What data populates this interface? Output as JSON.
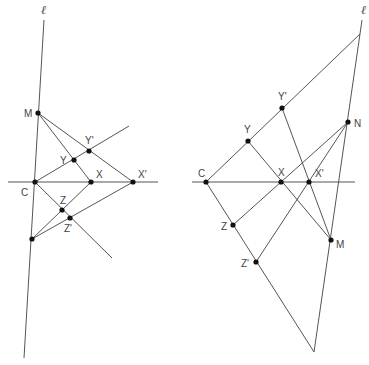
{
  "figure": {
    "left": {
      "line_label": "ℓ",
      "labels": {
        "M": "M",
        "Y": "Y",
        "Y_prime": "Y'",
        "C": "C",
        "X": "X",
        "X_prime": "X'",
        "Z": "Z",
        "Z_prime": "Z'"
      },
      "points": {
        "M": [
          38,
          113
        ],
        "Y": [
          74,
          160
        ],
        "Y_prime": [
          89,
          151
        ],
        "C": [
          35,
          182
        ],
        "X": [
          91,
          182
        ],
        "X_prime": [
          133,
          182
        ],
        "Z": [
          62,
          210
        ],
        "Z_prime": [
          70,
          218
        ],
        "P": [
          32,
          239
        ]
      }
    },
    "right": {
      "line_label": "ℓ",
      "labels": {
        "Y_prime": "Y'",
        "Y": "Y",
        "N": "N",
        "C": "C",
        "X": "X",
        "X_prime": "X'",
        "Z": "Z",
        "M": "M",
        "Z_prime": "Z'"
      },
      "points": {
        "Y_prime": [
          282,
          108
        ],
        "Y": [
          248,
          141
        ],
        "N": [
          348,
          122
        ],
        "C": [
          206,
          182
        ],
        "X": [
          281,
          182
        ],
        "X_prime": [
          309,
          182
        ],
        "Z": [
          233,
          225
        ],
        "M": [
          331,
          240
        ],
        "Z_prime": [
          256,
          262
        ]
      }
    }
  }
}
